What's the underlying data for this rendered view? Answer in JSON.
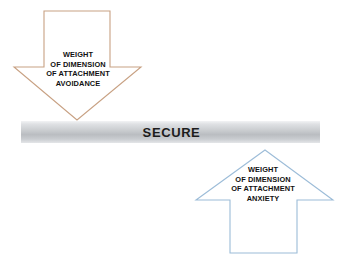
{
  "figure": {
    "name": "attachment-dimensions-diagram",
    "background_color": "#ffffff"
  },
  "center_bar": {
    "label": "SECURE",
    "text_color": "#1c1c1c",
    "gradient_light": "#f2f3f5",
    "gradient_dark": "#babdc1"
  },
  "arrows": {
    "avoidance": {
      "direction": "down",
      "outline_color": "#c8a183",
      "fill_color": "#ffffff",
      "lines": [
        "WEIGHT",
        "OF DIMENSION",
        "OF ATTACHMENT",
        "AVOIDANCE"
      ]
    },
    "anxiety": {
      "direction": "up",
      "outline_color": "#9cbcd8",
      "fill_color": "#ffffff",
      "lines": [
        "WEIGHT",
        "OF DIMENSION",
        "OF ATTACHMENT",
        "ANXIETY"
      ]
    }
  }
}
